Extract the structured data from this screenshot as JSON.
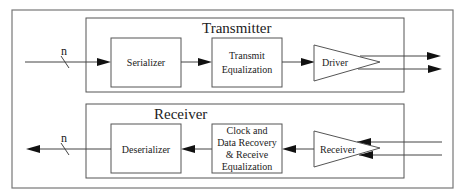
{
  "diagram": {
    "transmitter": {
      "title": "Transmitter",
      "bus_width_label": "n",
      "blocks": [
        {
          "id": "serializer",
          "lines": [
            "Serializer"
          ]
        },
        {
          "id": "transmit-equalization",
          "lines": [
            "Transmit",
            "Equalization"
          ]
        },
        {
          "id": "driver",
          "lines": [
            "Driver"
          ]
        }
      ]
    },
    "receiver": {
      "title": "Receiver",
      "bus_width_label": "n",
      "blocks": [
        {
          "id": "deserializer",
          "lines": [
            "Deserializer"
          ]
        },
        {
          "id": "cdr-receive-equalization",
          "lines": [
            "Clock and",
            "Data Recovery",
            "& Receive",
            "Equalization"
          ]
        },
        {
          "id": "receiver-amp",
          "lines": [
            "Receiver"
          ]
        }
      ]
    },
    "colors": {
      "line": "#444444",
      "arrow": "#111111",
      "frame": "#777777"
    }
  }
}
